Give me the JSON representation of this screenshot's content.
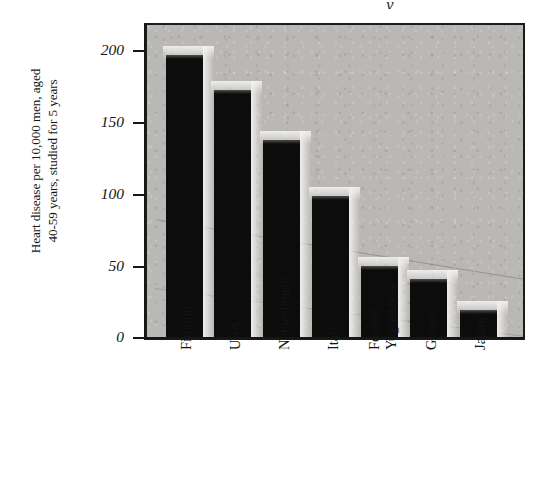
{
  "figure": {
    "title_fragment": "y",
    "axis": {
      "y_label_lines": [
        "Heart disease per 10,000 men, aged",
        "40-59 years, studied for 5 years"
      ],
      "y_ticks": [
        "200",
        "150",
        "100",
        "50",
        "0"
      ]
    },
    "colors": {
      "plot_background": "#b9b8b5",
      "bar_fill": "#0c0c0c",
      "frame": "#1a1a1a",
      "text": "#131313",
      "page_background": "#ffffff"
    }
  },
  "chart_data": {
    "type": "bar",
    "title": "",
    "xlabel": "",
    "ylabel": "Heart disease per 10,000 men, aged 40-59 years, studied for 5 years",
    "categories": [
      "Finland",
      "USA",
      "Netherlansds",
      "Italy",
      "Former Yugoslavia",
      "Greece",
      "Japan"
    ],
    "category_label_lines": [
      [
        "Finland"
      ],
      [
        "USA"
      ],
      [
        "Netherlansds"
      ],
      [
        "Italy"
      ],
      [
        "Former",
        "Yugoslavia"
      ],
      [
        "Greece"
      ],
      [
        "Japan"
      ]
    ],
    "values": [
      200,
      175,
      140,
      100,
      51,
      42,
      20
    ],
    "ylim": [
      0,
      221
    ],
    "yticks": [
      0,
      50,
      100,
      150,
      200
    ],
    "grid": false,
    "legend": false,
    "orientation": "vertical"
  }
}
